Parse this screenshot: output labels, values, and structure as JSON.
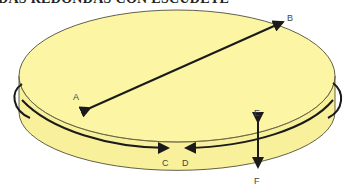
{
  "title": "DAS REDONDAS CON ESCUDETE",
  "labels": {
    "a": "A",
    "b": "B",
    "c": "C",
    "d": "D",
    "e": "E",
    "f": "F"
  },
  "colors": {
    "fill": "#fbf5a4",
    "fill_side": "#f8f09a",
    "outline": "#3a3a2a",
    "arrow": "#1a1a1a"
  }
}
